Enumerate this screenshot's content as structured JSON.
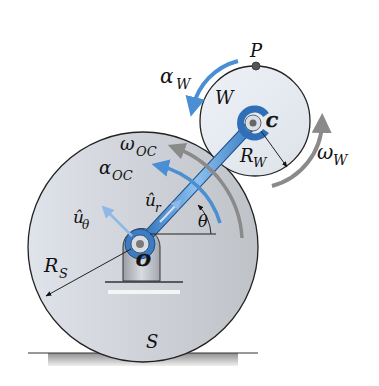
{
  "diagram": {
    "labels": {
      "P": "P",
      "W": "W",
      "C": "C",
      "O": "O",
      "S": "S",
      "alpha": "α",
      "omega": "ω",
      "R": "R",
      "u_hat": "û",
      "theta": "θ",
      "sub_W": "W",
      "sub_OC": "OC",
      "sub_S": "S",
      "sub_r": "r",
      "sub_theta": "θ"
    },
    "colors": {
      "disk_fill": "#d4d6da",
      "wheel_fill": "#e8ecf2",
      "blue": "#4a8fd4",
      "gray_arrow": "#8a8a8a",
      "outline": "#222222",
      "ground": "#9a9a9a"
    }
  }
}
